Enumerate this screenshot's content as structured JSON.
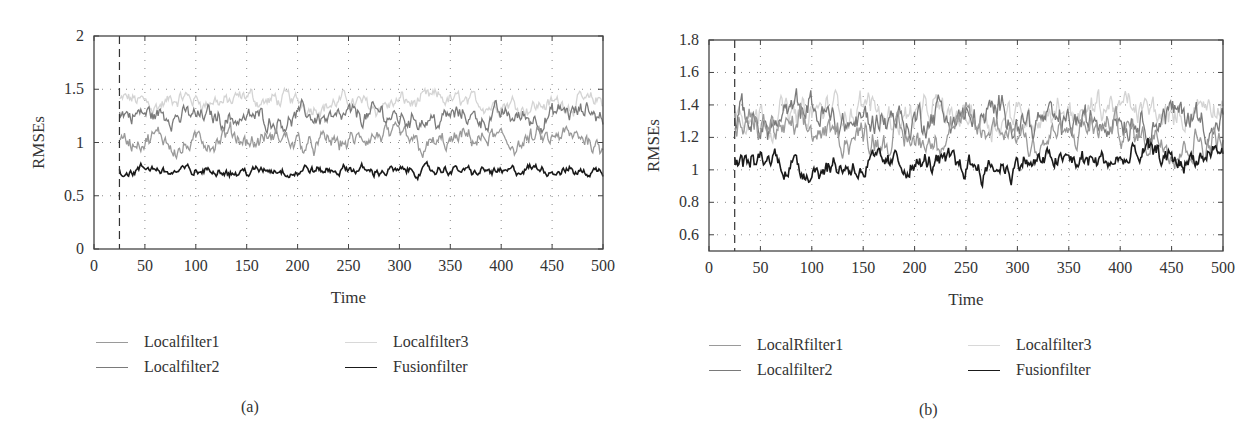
{
  "figure": {
    "panels": [
      {
        "id": "a",
        "caption": "(a)",
        "xlabel": "Time",
        "ylabel": "RMSEs",
        "xticks": [
          "0",
          "50",
          "100",
          "150",
          "200",
          "250",
          "300",
          "350",
          "400",
          "450",
          "500"
        ],
        "yticks": [
          "0",
          "0.5",
          "1",
          "1.5",
          "2"
        ],
        "legend": [
          {
            "label": "Localfilter1",
            "color": "#9a9a9a"
          },
          {
            "label": "Localfilter2",
            "color": "#7a7a7a"
          },
          {
            "label": "Localfilter3",
            "color": "#d4d4d4"
          },
          {
            "label": "Fusionfilter",
            "color": "#1a1a1a"
          }
        ]
      },
      {
        "id": "b",
        "caption": "(b)",
        "xlabel": "Time",
        "ylabel": "RMSEs",
        "xticks": [
          "0",
          "50",
          "100",
          "150",
          "200",
          "250",
          "300",
          "350",
          "400",
          "450",
          "500"
        ],
        "yticks": [
          "0.6",
          "0.8",
          "1",
          "1.2",
          "1.4",
          "1.6",
          "1.8"
        ],
        "legend": [
          {
            "label": "LocalRfilter1",
            "color": "#9a9a9a"
          },
          {
            "label": "Localfilter2",
            "color": "#7a7a7a"
          },
          {
            "label": "Localfilter3",
            "color": "#d4d4d4"
          },
          {
            "label": "Fusionfilter",
            "color": "#1a1a1a"
          }
        ]
      }
    ]
  },
  "chart_data": [
    {
      "type": "line",
      "panel": "(a)",
      "title": "",
      "xlabel": "Time",
      "ylabel": "RMSEs",
      "xlim": [
        0,
        500
      ],
      "ylim": [
        0,
        2
      ],
      "grid": true,
      "vline_dashed_at": 25,
      "x_range_plotted": [
        25,
        500
      ],
      "legend_position": "below",
      "series": [
        {
          "name": "Localfilter1",
          "color": "#9a9a9a",
          "mean": 1.0,
          "amplitude": 0.12,
          "approx_range": [
            0.85,
            1.2
          ]
        },
        {
          "name": "Localfilter2",
          "color": "#7a7a7a",
          "mean": 1.25,
          "amplitude": 0.12,
          "approx_range": [
            1.05,
            1.45
          ]
        },
        {
          "name": "Localfilter3",
          "color": "#d4d4d4",
          "mean": 1.38,
          "amplitude": 0.1,
          "approx_range": [
            1.2,
            1.6
          ]
        },
        {
          "name": "Fusionfilter",
          "color": "#1a1a1a",
          "mean": 0.73,
          "amplitude": 0.06,
          "approx_range": [
            0.6,
            0.92
          ]
        }
      ]
    },
    {
      "type": "line",
      "panel": "(b)",
      "title": "",
      "xlabel": "Time",
      "ylabel": "RMSEs",
      "xlim": [
        0,
        500
      ],
      "ylim": [
        0.5,
        1.8
      ],
      "grid": true,
      "vline_dashed_at": 25,
      "x_range_plotted": [
        25,
        500
      ],
      "legend_position": "below",
      "series": [
        {
          "name": "LocalRfilter1",
          "color": "#9a9a9a",
          "mean": 1.22,
          "amplitude": 0.12,
          "approx_range": [
            1.0,
            1.45
          ]
        },
        {
          "name": "Localfilter2",
          "color": "#7a7a7a",
          "mean": 1.32,
          "amplitude": 0.13,
          "approx_range": [
            1.1,
            1.65
          ]
        },
        {
          "name": "Localfilter3",
          "color": "#d4d4d4",
          "mean": 1.36,
          "amplitude": 0.12,
          "approx_range": [
            1.15,
            1.65
          ]
        },
        {
          "name": "Fusionfilter",
          "color": "#1a1a1a",
          "mean": 1.05,
          "amplitude": 0.09,
          "approx_range": [
            0.85,
            1.25
          ]
        }
      ]
    }
  ]
}
